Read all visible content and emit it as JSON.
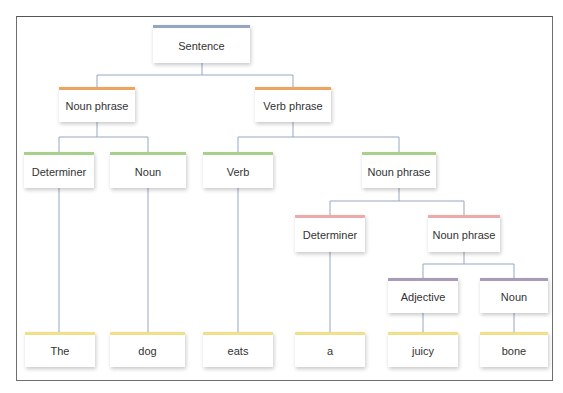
{
  "diagram": {
    "type": "syntax-tree",
    "colors": {
      "sentence": "#94a6c2",
      "phrase": "#eea45e",
      "level2": "#a9d08a",
      "level3": "#ecaaaa",
      "level4": "#a89ab8",
      "leaf": "#f1e08a",
      "connector": "#93a7c4",
      "frame": "#6e6e6e"
    },
    "nodes": {
      "sentence": "Sentence",
      "noun_phrase_1": "Noun phrase",
      "verb_phrase": "Verb phrase",
      "determiner_1": "Determiner",
      "noun_1": "Noun",
      "verb": "Verb",
      "noun_phrase_2": "Noun phrase",
      "determiner_2": "Determiner",
      "noun_phrase_3": "Noun phrase",
      "adjective": "Adjective",
      "noun_2": "Noun",
      "word_the": "The",
      "word_dog": "dog",
      "word_eats": "eats",
      "word_a": "a",
      "word_juicy": "juicy",
      "word_bone": "bone"
    }
  }
}
